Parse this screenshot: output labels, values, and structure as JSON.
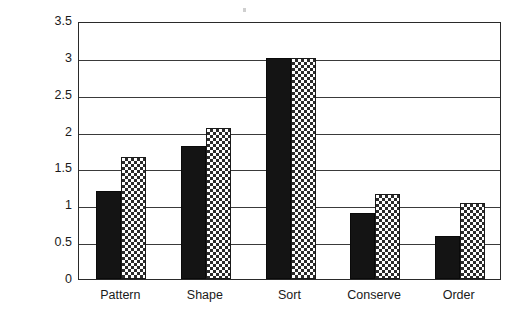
{
  "chart_data": {
    "type": "bar",
    "title": "",
    "xlabel": "",
    "ylabel": "Average score",
    "ylim": [
      0,
      3.5
    ],
    "yticks": [
      "0",
      "0.5",
      "1",
      "1.5",
      "2",
      "2.5",
      "3",
      "3.5"
    ],
    "ytick_values": [
      0,
      0.5,
      1,
      1.5,
      2,
      2.5,
      3,
      3.5
    ],
    "grid": true,
    "legend_position": "none",
    "categories": [
      "Pattern",
      "Shape",
      "Sort",
      "Conserve",
      "Order"
    ],
    "series": [
      {
        "name": "series-1-solid-black",
        "fill": "solid-black",
        "values": [
          1.2,
          1.8,
          3.0,
          0.9,
          0.58
        ]
      },
      {
        "name": "series-2-checkered",
        "fill": "checkered",
        "values": [
          1.65,
          2.05,
          3.0,
          1.15,
          1.03
        ]
      }
    ],
    "colors": {
      "series_1": "#141414",
      "series_2_pattern_fg": "#2b2b2b",
      "series_2_pattern_bg": "#ffffff",
      "axis": "#2a2a2a",
      "gridline": "#3a3a3a",
      "background": "#ffffff",
      "text": "#1a1a1a"
    }
  }
}
